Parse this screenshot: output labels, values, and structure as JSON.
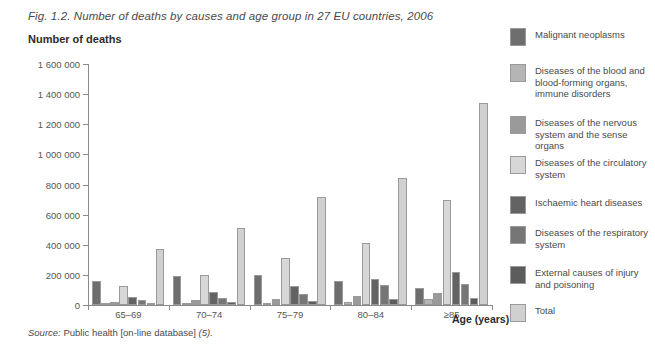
{
  "figure": {
    "title": "Fig. 1.2. Number of deaths by causes and age group in 27 EU countries, 2006",
    "y_axis_title": "Number of deaths",
    "x_axis_title": "Age (years)",
    "source_prefix": "Source:",
    "source_text": "Public health [on-line database]",
    "source_ref": "(5)."
  },
  "chart_data": {
    "type": "bar",
    "title": "Fig. 1.2. Number of deaths by causes and age group in 27 EU countries, 2006",
    "xlabel": "Age (years)",
    "ylabel": "Number of deaths",
    "ylim": [
      0,
      1600000
    ],
    "yticks": [
      0,
      200000,
      400000,
      600000,
      800000,
      1000000,
      1200000,
      1400000,
      1600000
    ],
    "ytick_labels": [
      "0",
      "200 000",
      "400 000",
      "600 000",
      "800 000",
      "1 000 000",
      "1 200 000",
      "1 400 000",
      "1 600 000"
    ],
    "grid": false,
    "legend_position": "right",
    "categories": [
      "65–69",
      "70–74",
      "75–79",
      "80–84",
      "≥85"
    ],
    "series": [
      {
        "name": "Malignant neoplasms",
        "color": "#6e6e6e",
        "values": [
          160000,
          195000,
          200000,
          160000,
          110000
        ]
      },
      {
        "name": "Diseases of the blood and blood-forming organs, immune disorders",
        "color": "#b5b5b5",
        "values": [
          8000,
          12000,
          16000,
          22000,
          42000
        ]
      },
      {
        "name": "Diseases of the nervous system and the sense organs",
        "color": "#9a9a9a",
        "values": [
          22000,
          30000,
          42000,
          58000,
          80000
        ]
      },
      {
        "name": "Diseases of the circulatory system",
        "color": "#d7d7d7",
        "values": [
          125000,
          200000,
          310000,
          410000,
          695000
        ]
      },
      {
        "name": "Ischaemic heart diseases",
        "color": "#636363",
        "values": [
          55000,
          85000,
          125000,
          170000,
          220000
        ]
      },
      {
        "name": "Diseases of the respiratory system",
        "color": "#767676",
        "values": [
          30000,
          45000,
          75000,
          130000,
          140000
        ]
      },
      {
        "name": "External causes of injury and poisoning",
        "color": "#5c5c5c",
        "values": [
          12000,
          20000,
          25000,
          40000,
          45000
        ]
      },
      {
        "name": "Total",
        "color": "#d0d0d0",
        "values": [
          370000,
          510000,
          720000,
          845000,
          1340000
        ]
      }
    ]
  },
  "legend": {
    "items": [
      {
        "label": "Malignant neoplasms",
        "color": "#6e6e6e",
        "top": 0
      },
      {
        "label": "Diseases of the blood and blood-forming organs, immune disorders",
        "color": "#b5b5b5",
        "top": 36
      },
      {
        "label": "Diseases of the nervous system and the sense organs",
        "color": "#9a9a9a",
        "top": 88
      },
      {
        "label": "Diseases of the circulatory system",
        "color": "#d7d7d7",
        "top": 128
      },
      {
        "label": "Ischaemic heart diseases",
        "color": "#636363",
        "top": 168
      },
      {
        "label": "Diseases of the respiratory system",
        "color": "#767676",
        "top": 198
      },
      {
        "label": "External causes of injury and poisoning",
        "color": "#5c5c5c",
        "top": 238
      },
      {
        "label": "Total",
        "color": "#d0d0d0",
        "top": 276
      }
    ]
  }
}
